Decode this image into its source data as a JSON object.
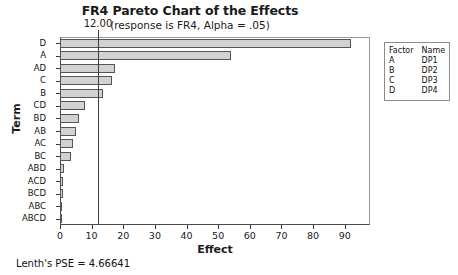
{
  "chart_data": {
    "type": "bar",
    "orientation": "horizontal",
    "title": "FR4 Pareto Chart of the Effects",
    "subtitle": "(response is FR4, Alpha = .05)",
    "xlabel": "Effect",
    "ylabel": "Term",
    "categories": [
      "D",
      "A",
      "AD",
      "C",
      "B",
      "CD",
      "BD",
      "AB",
      "AC",
      "BC",
      "ABD",
      "ACD",
      "BCD",
      "ABC",
      "ABCD"
    ],
    "values": [
      92.0,
      54.0,
      17.5,
      16.5,
      13.5,
      8.0,
      6.0,
      5.0,
      4.0,
      3.4,
      1.4,
      1.0,
      0.8,
      0.6,
      0.4
    ],
    "xlim": [
      0,
      98
    ],
    "xticks": [
      0,
      10,
      20,
      30,
      40,
      50,
      60,
      70,
      80,
      90
    ],
    "xtick_labels": [
      "0",
      "10",
      "20",
      "30",
      "40",
      "50",
      "60",
      "70",
      "80",
      "90"
    ],
    "grid": false,
    "bar_color": "#d2d2d2",
    "bar_edge_color": "#555555",
    "reference_line": {
      "value": 12.0,
      "label": "12.00",
      "color": "#3c3c3c"
    },
    "legend": {
      "position": "right-outside",
      "headers": [
        "Factor",
        "Name"
      ],
      "rows": [
        {
          "factor": "A",
          "name": "DP1"
        },
        {
          "factor": "B",
          "name": "DP2"
        },
        {
          "factor": "C",
          "name": "DP3"
        },
        {
          "factor": "D",
          "name": "DP4"
        }
      ]
    },
    "annotations": [
      {
        "text": "Lenth's PSE = 4.66641",
        "position": "below-axis-left"
      }
    ]
  },
  "footer": {
    "lenth_pse": "Lenth's PSE = 4.66641"
  }
}
